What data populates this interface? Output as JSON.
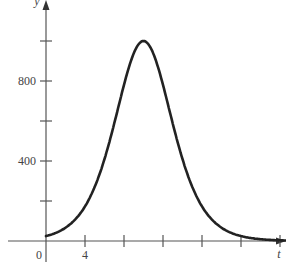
{
  "chart_data": {
    "type": "line",
    "title": "",
    "xlabel": "t",
    "ylabel": "y",
    "x_ticks": [
      0,
      4,
      8,
      12,
      16,
      20,
      24
    ],
    "x_tick_labels": [
      "0",
      "4"
    ],
    "y_ticks": [
      0,
      200,
      400,
      600,
      800,
      1000
    ],
    "y_tick_labels": [
      "400",
      "800"
    ],
    "xlim": [
      0,
      25
    ],
    "ylim": [
      0,
      1050
    ],
    "grid": false,
    "series": [
      {
        "name": "y(t)",
        "x": [
          0,
          2,
          4,
          6,
          8,
          9,
          10,
          11,
          12,
          14,
          16,
          18,
          20,
          22,
          24,
          25
        ],
        "values": [
          25,
          80,
          190,
          420,
          780,
          940,
          1000,
          940,
          780,
          420,
          190,
          80,
          30,
          10,
          3,
          2
        ]
      }
    ],
    "colors": {
      "axis": "#555555",
      "curve": "#222222",
      "text": "#444444"
    }
  }
}
